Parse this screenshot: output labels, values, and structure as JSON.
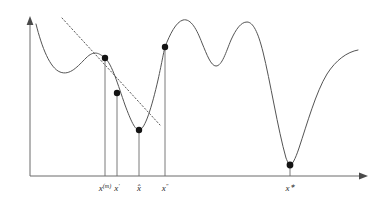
{
  "figure": {
    "background_color": "#ffffff",
    "curve_color": "#545454",
    "axis_color": "#6b6b6b",
    "marker_color": "#141414",
    "tangent_color": "#5a5a5a"
  },
  "axes": {
    "x_axis": {
      "name": "horizontal-axis",
      "start_x": 30,
      "end_x": 368,
      "y": 176,
      "arrow": true,
      "label": ""
    },
    "y_axis": {
      "name": "vertical-axis",
      "x": 30,
      "start_y": 176,
      "end_y": 16,
      "arrow": true,
      "label": ""
    }
  },
  "ticks": [
    {
      "id": "xm",
      "base": "x",
      "sup": "(m)",
      "x": 105,
      "label": "x(m)"
    },
    {
      "id": "xp",
      "base": "x",
      "sup": "′",
      "x": 117,
      "label": "x′"
    },
    {
      "id": "xhat",
      "base": "x̂",
      "sup": "",
      "x": 139,
      "label": "x̂"
    },
    {
      "id": "xpp",
      "base": "x",
      "sup": "″",
      "x": 165,
      "label": "x″"
    },
    {
      "id": "xstar",
      "base": "x",
      "sup": "∗",
      "x": 290,
      "label": "x∗"
    }
  ],
  "markers": [
    {
      "name": "point-xm",
      "x": 105,
      "y": 58,
      "radius": 3.2,
      "tick": "xm"
    },
    {
      "name": "point-xp",
      "x": 117,
      "y": 93,
      "radius": 3.2,
      "tick": "xp"
    },
    {
      "name": "point-xhat",
      "x": 139,
      "y": 130,
      "radius": 3.2,
      "tick": "xhat"
    },
    {
      "name": "point-xpp",
      "x": 165,
      "y": 47,
      "radius": 3.2,
      "tick": "xpp"
    },
    {
      "name": "point-xstar",
      "x": 290,
      "y": 165,
      "radius": 3.4,
      "tick": "xstar"
    }
  ],
  "drop_lines": [
    {
      "name": "dropline-xm",
      "x": 105,
      "y_top": 58,
      "y_bottom": 176
    },
    {
      "name": "dropline-xp",
      "x": 117,
      "y_top": 93,
      "y_bottom": 176
    },
    {
      "name": "dropline-xhat",
      "x": 139,
      "y_top": 130,
      "y_bottom": 176
    },
    {
      "name": "dropline-xpp",
      "x": 165,
      "y_top": 47,
      "y_bottom": 176
    },
    {
      "name": "dropline-xstar",
      "x": 290,
      "y_top": 165,
      "y_bottom": 176
    }
  ],
  "tangent": {
    "name": "tangent-dotted-line",
    "x1": 62,
    "y1": 18,
    "x2": 160,
    "y2": 125,
    "style": "dotted",
    "anchor_point": "xm"
  },
  "curve": {
    "name": "objective-function-curve",
    "path": "M 36,24 C 42,48 50,68 60,72 C 70,76 78,66 86,58 C 94,50 99,53 105,58 C 112,64 118,85 125,105 C 131,121 135,130 139,130 C 145,130 152,106 158,80 C 162,62 164,50 165,47 C 170,34 176,22 183,20 C 191,18 197,30 202,43 C 207,55 211,66 216,66 C 222,66 226,52 231,40 C 236,29 241,22 247,22 C 253,22 258,32 263,52 C 270,80 278,130 286,158 C 288,163 289,165 290,165 C 292,165 295,160 299,148 C 307,124 316,92 327,74 C 336,60 347,52 358,50",
    "stroke_width": 1
  },
  "chart_data": {
    "type": "line",
    "title": "",
    "xlabel": "",
    "ylabel": "",
    "grid": false,
    "legend": false,
    "categories": [
      "x(m)",
      "x′",
      "x̂",
      "x″",
      "x∗"
    ],
    "series": [
      {
        "name": "objective",
        "marked_points": [
          {
            "label": "x(m)",
            "x_px": 105,
            "y_px": 58
          },
          {
            "label": "x′",
            "x_px": 117,
            "y_px": 93
          },
          {
            "label": "x̂",
            "x_px": 139,
            "y_px": 130
          },
          {
            "label": "x″",
            "x_px": 165,
            "y_px": 47
          },
          {
            "label": "x∗",
            "x_px": 290,
            "y_px": 165
          }
        ]
      }
    ],
    "annotations": [
      {
        "type": "dotted-tangent",
        "at": "x(m)"
      }
    ]
  }
}
